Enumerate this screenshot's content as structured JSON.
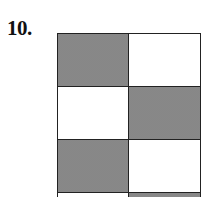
{
  "problem": {
    "number_label": "10.",
    "grid": {
      "columns": 2,
      "visible_rows": 4,
      "cells": [
        [
          "shaded",
          "white"
        ],
        [
          "white",
          "shaded"
        ],
        [
          "shaded",
          "white"
        ],
        [
          "white",
          "shaded"
        ]
      ],
      "colors": {
        "shaded": "#8c8c8c",
        "white": "#ffffff",
        "border": "#222222"
      }
    }
  }
}
